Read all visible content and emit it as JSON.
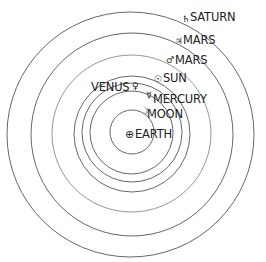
{
  "diagram": {
    "type": "geocentric-model",
    "center_body": {
      "name": "EARTH",
      "symbol": "⊕"
    },
    "orbits": [
      {
        "name": "MOON",
        "symbol": "☽",
        "order": 1
      },
      {
        "name": "MERCURY",
        "symbol": "☿",
        "order": 2
      },
      {
        "name": "VENUS",
        "symbol": "♀",
        "order": 3
      },
      {
        "name": "SUN",
        "symbol": "☉",
        "order": 4
      },
      {
        "name": "MARS",
        "symbol": "♂",
        "order": 5
      },
      {
        "name": "JUPITER",
        "symbol": "♃",
        "order": 6
      },
      {
        "name": "SATURN",
        "symbol": "♄",
        "order": 7
      }
    ],
    "colors": {
      "line": "#555555",
      "text": "#222222",
      "background": "#ffffff"
    }
  }
}
